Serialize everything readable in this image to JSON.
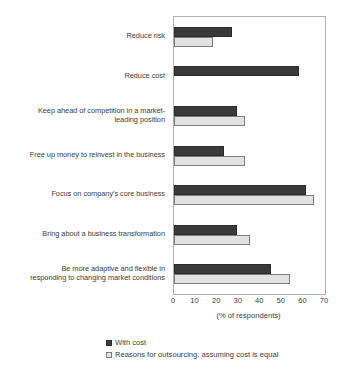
{
  "chart_data": {
    "type": "bar",
    "orientation": "horizontal",
    "title": "",
    "xlabel": "(% of respondents)",
    "ylabel": "",
    "xlim": [
      0,
      70
    ],
    "xticks": [
      0,
      10,
      20,
      30,
      40,
      50,
      60,
      70
    ],
    "grid": false,
    "legend_position": "bottom-left",
    "categories": [
      "Reduce risk",
      "Reduce cost",
      "Keep ahead of competition in a market-leading position",
      "Free up money to reinvest in the business",
      "Focus on company's core business",
      "Bring about a business transformation",
      "Be more adaptive and flexible in responding to changing market conditions"
    ],
    "series": [
      {
        "name": "With cost",
        "color": "#3a3a3a",
        "values": [
          27,
          58,
          29,
          23,
          61,
          29,
          45
        ]
      },
      {
        "name": "Reasons for outsourcing, assuming cost is equal",
        "color": "#e2e2e2",
        "values": [
          18,
          0,
          33,
          33,
          65,
          35,
          54
        ]
      }
    ]
  },
  "axis": {
    "tick_labels": [
      "0",
      "10",
      "20",
      "30",
      "40",
      "50",
      "60",
      "70"
    ],
    "title": "(% of respondents)"
  },
  "categories": {
    "items": [
      {
        "lines": [
          "Reduce risk"
        ]
      },
      {
        "lines": [
          "Reduce cost"
        ]
      },
      {
        "lines": [
          "Keep ahead of competition in a market-",
          "leading position"
        ]
      },
      {
        "lines": [
          "Free up money to reinvest in the business"
        ]
      },
      {
        "lines": [
          "Focus on company's core business"
        ]
      },
      {
        "lines": [
          "Bring about a business transformation"
        ]
      },
      {
        "lines": [
          "Be more adaptive and flexible in",
          "responding to changing market conditions"
        ]
      }
    ]
  },
  "legend": {
    "entries": [
      {
        "label": "With cost",
        "swatch": "dark"
      },
      {
        "label": "Reasons for outsourcing, assuming cost is equal",
        "swatch": "light"
      }
    ]
  }
}
